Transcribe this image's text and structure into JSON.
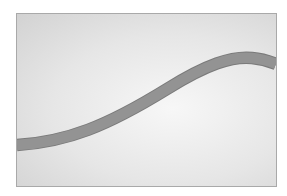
{
  "image": {
    "description": "Gray gradient rectangular frame with a single S-shaped darker gray band curving from lower-left to upper-right",
    "colors": {
      "border": "#a9a9a9",
      "background_light": "#f7f7f7",
      "background_dark": "#d2d2d2",
      "band_fill": "#8f8f8f",
      "band_edge": "#7a7a7a"
    }
  }
}
